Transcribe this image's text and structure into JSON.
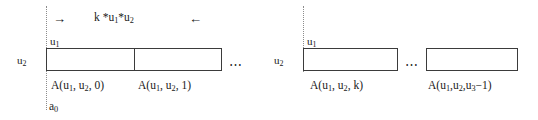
{
  "figure": {
    "type": "array-memory-layout-diagram",
    "annotation_top": {
      "left_arrow_glyph": "→",
      "right_arrow_glyph": "←",
      "stride_label": "k *u1*u2"
    },
    "groups": [
      {
        "id": "group-left",
        "base_pointer_label": "a0",
        "row_extent_label": "u2",
        "col_extent_label": "u1",
        "ellipsis": "···",
        "cells": [
          {
            "label": "A(u1, u2, 0)"
          },
          {
            "label": "A(u1, u2, 1)"
          }
        ]
      },
      {
        "id": "group-right",
        "row_extent_label": "u2",
        "col_extent_label": "u1",
        "ellipsis": "···",
        "cells": [
          {
            "label": "A(u1, u2, k)"
          },
          {
            "label": "A(u1,u2,u3−1)"
          }
        ]
      }
    ],
    "colors": {
      "background": "#ffffff",
      "cell_border": "#3b3b3b",
      "guide_line": "#8c8c8c",
      "text": "#1a1a1a"
    }
  }
}
